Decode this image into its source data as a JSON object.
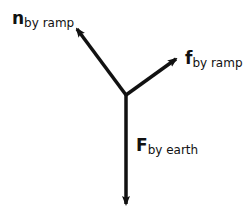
{
  "diagram": {
    "type": "free-body diagram",
    "origin": [
      126,
      95
    ],
    "vectors": [
      {
        "symbol": "n",
        "subscript": "by ramp",
        "direction": "up-left",
        "tip": [
          75,
          27
        ]
      },
      {
        "symbol": "f",
        "subscript": "by ramp",
        "direction": "up-right",
        "tip": [
          178,
          57
        ]
      },
      {
        "symbol": "F",
        "subscript": "by earth",
        "direction": "down",
        "tip": [
          126,
          206
        ]
      }
    ],
    "color": "#111111"
  }
}
